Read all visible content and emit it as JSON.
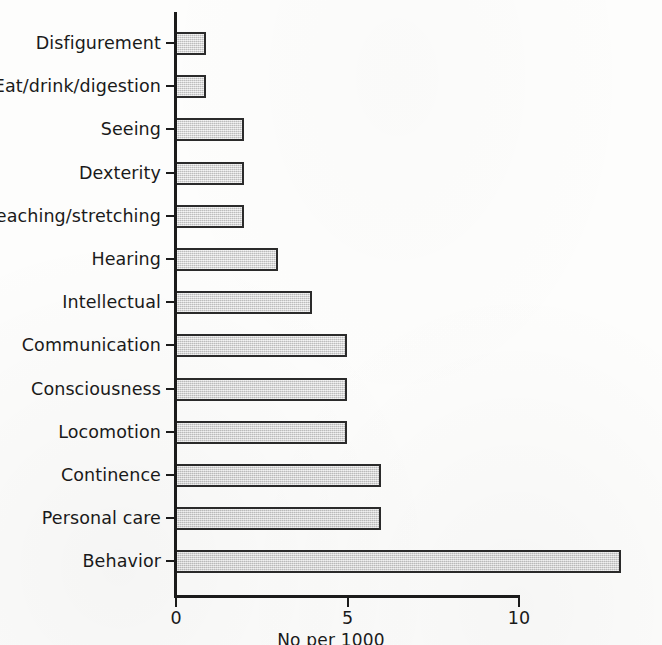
{
  "chart_data": {
    "type": "bar",
    "orientation": "horizontal",
    "title": "",
    "subtitle": "",
    "xlabel": "No per 1000",
    "ylabel": "",
    "xlim": [
      0,
      13.6
    ],
    "xticks": [
      0,
      5,
      10
    ],
    "xtick_labels": [
      "0",
      "5",
      "10"
    ],
    "grid": false,
    "legend": null,
    "bar_fill_color": "#d2d2d2",
    "bar_border_color": "#2b2b2b",
    "axis_color": "#1b1b1b",
    "text_color": "#1a1a1a",
    "background_color": "#fdfdfc",
    "categories": [
      "Disfigurement",
      "Eat/drink/digestion",
      "Seeing",
      "Dexterity",
      "Reaching/stretching",
      "Hearing",
      "Intellectual",
      "Communication",
      "Consciousness",
      "Locomotion",
      "Continence",
      "Personal care",
      "Behavior"
    ],
    "values": [
      0.9,
      0.9,
      2,
      2,
      2,
      3,
      4,
      5,
      5,
      5,
      6,
      6,
      13
    ]
  }
}
